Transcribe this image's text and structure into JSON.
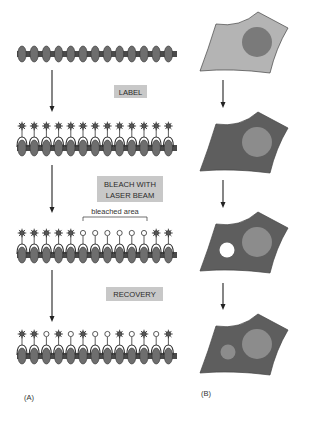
{
  "panel_a": {
    "label": "(A)",
    "steps": [
      {
        "name": "unlabeled",
        "molecules": [
          "none",
          "none",
          "none",
          "none",
          "none",
          "none",
          "none",
          "none",
          "none",
          "none",
          "none",
          "none",
          "none"
        ]
      },
      {
        "name": "labeled",
        "molecules": [
          "star",
          "star",
          "star",
          "star",
          "star",
          "star",
          "star",
          "star",
          "star",
          "star",
          "star",
          "star",
          "star"
        ]
      },
      {
        "name": "bleached",
        "molecules": [
          "star",
          "star",
          "star",
          "star",
          "star",
          "circle",
          "circle",
          "circle",
          "circle",
          "circle",
          "circle",
          "star",
          "star"
        ]
      },
      {
        "name": "recovery",
        "molecules": [
          "star",
          "star",
          "circle",
          "star",
          "circle",
          "star",
          "circle",
          "circle",
          "star",
          "circle",
          "star",
          "circle",
          "star"
        ]
      }
    ],
    "step_labels": [
      "LABEL",
      "BLEACH WITH",
      "LASER BEAM",
      "RECOVERY"
    ],
    "bleached_area_label": "bleached area"
  },
  "panel_b": {
    "label": "(B)",
    "cells": [
      {
        "name": "unlabeled-cell",
        "state": "unlabeled"
      },
      {
        "name": "labeled-cell",
        "state": "labeled"
      },
      {
        "name": "bleached-cell",
        "state": "bleached-spot"
      },
      {
        "name": "recovered-cell",
        "state": "recovered-spot"
      }
    ]
  },
  "colors": {
    "membrane": "#4a4a4a",
    "protein": "#6e6e6e",
    "label_box": "#c8c8c8",
    "cell_light": "#b4b4b4",
    "cell_dark": "#5e5e5e",
    "nucleus_dark": "#7a7a7a",
    "nucleus_light": "#8c8c8c",
    "bleach_spot": "#ffffff",
    "recovered_spot": "#8c8c8c"
  }
}
